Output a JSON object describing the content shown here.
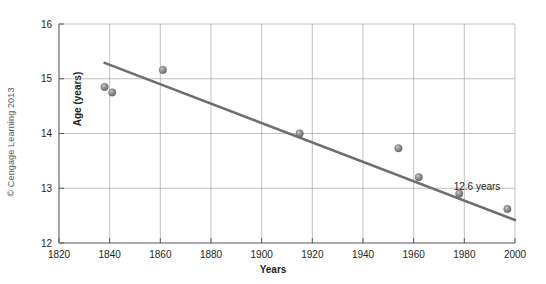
{
  "credit": {
    "text": "© Cengage Learning 2013"
  },
  "chart_data": {
    "type": "scatter",
    "title": "",
    "subtitle": "",
    "xlabel": "Years",
    "ylabel": "Age (years)",
    "xlim": [
      1820,
      2000
    ],
    "ylim": [
      12,
      16
    ],
    "xticks": [
      1820,
      1840,
      1860,
      1880,
      1900,
      1920,
      1940,
      1960,
      1980,
      2000
    ],
    "xtick_labels": [
      "1820",
      "1840",
      "1860",
      "1880",
      "1900",
      "1920",
      "1940",
      "1960",
      "1980",
      "2000"
    ],
    "yticks": [
      12,
      13,
      14,
      15,
      16
    ],
    "ytick_labels": [
      "12",
      "13",
      "14",
      "15",
      "16"
    ],
    "grid": true,
    "grid_color": "#9a9a9a",
    "legend": false,
    "legend_position": "none",
    "point_color": "#808285",
    "line_color": "#6d6e71",
    "series": [
      {
        "name": "Age at menarche",
        "type": "scatter",
        "x": [
          1838,
          1841,
          1861,
          1915,
          1954,
          1962,
          1978,
          1997
        ],
        "y": [
          14.85,
          14.75,
          15.16,
          14.0,
          13.73,
          13.2,
          12.9,
          12.62
        ]
      },
      {
        "name": "Trend line",
        "type": "line",
        "x": [
          1838,
          2000
        ],
        "y": [
          15.29,
          12.42
        ]
      }
    ],
    "annotations": [
      {
        "text": "12.6 years",
        "x": 1985,
        "y": 12.97
      }
    ]
  }
}
